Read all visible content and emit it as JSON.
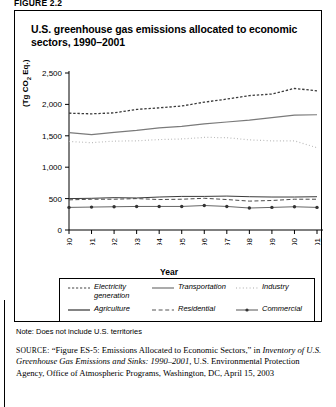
{
  "figure": {
    "caption": "FIGURE 2.2",
    "title": "U.S. greenhouse gas emissions allocated to economic sectors, 1990–2001",
    "note": "Note: Does not include U.S. territories",
    "source_label": "SOURCE:",
    "source_line1": "“Figure ES-5: Emissions Allocated to Economic Sectors,” in",
    "source_italic": "Inventory of U.S. Greenhouse Gas Emissions and Sinks: 1990–2001,",
    "source_line2": "U.S. Environmental Protection Agency, Office of Atmospheric",
    "source_line3": "Programs, Washington, DC, April 15, 2003"
  },
  "chart_data": {
    "type": "line",
    "title": "U.S. greenhouse gas emissions allocated to economic sectors, 1990–2001",
    "xlabel": "Year",
    "ylabel": "(Tg CO2 Eq.)",
    "categories": [
      1990,
      1991,
      1992,
      1993,
      1994,
      1995,
      1996,
      1997,
      1998,
      1999,
      2000,
      2001
    ],
    "x": [
      "1990",
      "1991",
      "1992",
      "1993",
      "1994",
      "1995",
      "1996",
      "1997",
      "1998",
      "1999",
      "2000",
      "2001"
    ],
    "xlim": [
      1990,
      2001
    ],
    "ylim": [
      0,
      2500
    ],
    "yticks": [
      "0",
      "500",
      "1,000",
      "1,500",
      "2,000",
      "2,500"
    ],
    "ytick_values": [
      0,
      500,
      1000,
      1500,
      2000,
      2500
    ],
    "grid": false,
    "legend_position": "below-plot",
    "series": [
      {
        "name": "Electricity generation",
        "style": "dashed",
        "values": [
          1860,
          1850,
          1865,
          1920,
          1945,
          1975,
          2035,
          2085,
          2140,
          2165,
          2255,
          2215
        ]
      },
      {
        "name": "Transportation",
        "style": "solid",
        "values": [
          1550,
          1520,
          1555,
          1585,
          1625,
          1650,
          1690,
          1720,
          1750,
          1790,
          1830,
          1835
        ]
      },
      {
        "name": "Industry",
        "style": "dotted",
        "values": [
          1410,
          1390,
          1415,
          1420,
          1440,
          1450,
          1475,
          1470,
          1435,
          1420,
          1420,
          1310
        ]
      },
      {
        "name": "Agriculture",
        "style": "solid-thin",
        "values": [
          500,
          505,
          515,
          510,
          525,
          535,
          535,
          540,
          530,
          525,
          525,
          530
        ]
      },
      {
        "name": "Residential",
        "style": "dashed-long",
        "values": [
          480,
          490,
          490,
          500,
          485,
          490,
          505,
          485,
          460,
          470,
          490,
          490
        ]
      },
      {
        "name": "Commercial",
        "style": "line-marker",
        "values": [
          360,
          365,
          370,
          375,
          375,
          375,
          390,
          375,
          350,
          360,
          370,
          360
        ]
      }
    ]
  },
  "legend": {
    "items": [
      {
        "label": "Electricity generation",
        "style": "dashed"
      },
      {
        "label": "Transportation",
        "style": "solid"
      },
      {
        "label": "Industry",
        "style": "dotted"
      },
      {
        "label": "Agriculture",
        "style": "solid-thin"
      },
      {
        "label": "Residential",
        "style": "dashed-long"
      },
      {
        "label": "Commercial",
        "style": "line-marker"
      }
    ]
  }
}
